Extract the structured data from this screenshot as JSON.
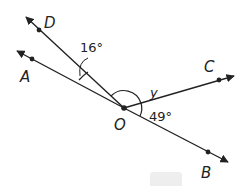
{
  "diagram": {
    "type": "geometry-angles",
    "vertex": {
      "label": "O",
      "x": 124,
      "y": 108
    },
    "rays": [
      {
        "name": "OD",
        "point_label": "D",
        "dot": [
          39,
          30
        ],
        "tip": [
          26,
          17
        ],
        "label_pos": [
          44,
          28
        ]
      },
      {
        "name": "OA",
        "point_label": "A",
        "dot": [
          32,
          57
        ],
        "tip": [
          17,
          51
        ],
        "label_pos": [
          20,
          82
        ]
      },
      {
        "name": "OC",
        "point_label": "C",
        "dot": [
          219,
          82
        ],
        "tip": [
          234,
          77
        ],
        "label_pos": [
          204,
          72
        ]
      },
      {
        "name": "OB",
        "point_label": "B",
        "dot": [
          208,
          152
        ],
        "tip": [
          228,
          162
        ],
        "label_pos": [
          201,
          178
        ]
      }
    ],
    "angles": [
      {
        "between": "DOA",
        "label": "16°",
        "label_pos": [
          80,
          52
        ]
      },
      {
        "between": "DOC",
        "label": "y",
        "label_pos": [
          150,
          97
        ]
      },
      {
        "between": "COB",
        "label": "49°",
        "label_pos": [
          149,
          121
        ]
      }
    ],
    "colors": {
      "line": "#222222",
      "text": "#222222",
      "placeholder_box": "#eeeeee"
    }
  }
}
